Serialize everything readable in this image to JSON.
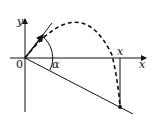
{
  "diagram": {
    "type": "projectile-on-incline",
    "labels": {
      "y_axis": "y",
      "x_axis": "x",
      "origin": "0",
      "angle": "α",
      "landing_x": "x"
    },
    "colors": {
      "stroke": "#111111",
      "background": "#ffffff"
    }
  }
}
